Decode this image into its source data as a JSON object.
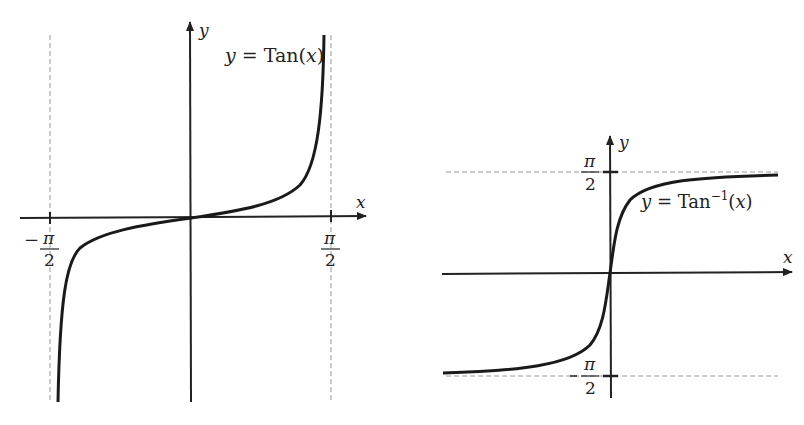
{
  "figure": {
    "left_plot": {
      "title": "y = Tan(x)",
      "equation_parts": {
        "lhs": "y",
        "eq": " = ",
        "fn": "Tan(",
        "arg": "x",
        "close": ")"
      },
      "x_axis_label": "x",
      "y_axis_label": "y",
      "tick_labels": {
        "neg_minus": "−",
        "neg_num": "π",
        "neg_den": "2",
        "pos_num": "π",
        "pos_den": "2"
      },
      "asymptotes": [
        "x = -π/2",
        "x = π/2"
      ]
    },
    "right_plot": {
      "title": "y = Tan⁻¹(x)",
      "equation_parts": {
        "lhs": "y",
        "eq": " = ",
        "fn": "Tan",
        "sup": "−1",
        "open": "(",
        "arg": "x",
        "close": ")"
      },
      "x_axis_label": "x",
      "y_axis_label": "y",
      "tick_labels": {
        "top_num": "π",
        "top_den": "2",
        "bottom_minus": "−",
        "bottom_num": "π",
        "bottom_den": "2"
      },
      "asymptotes": [
        "y = π/2",
        "y = -π/2"
      ]
    },
    "colors": {
      "curve": "#1a1a1a",
      "axis": "#222222",
      "dashed": "#9a9a9a",
      "background": "#ffffff"
    }
  }
}
